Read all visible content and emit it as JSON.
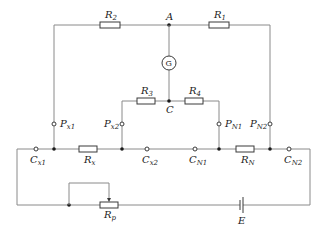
{
  "diagram": {
    "title": "",
    "resistors": {
      "R1": {
        "main": "R",
        "sub": "1"
      },
      "R2": {
        "main": "R",
        "sub": "2"
      },
      "R3": {
        "main": "R",
        "sub": "3"
      },
      "R4": {
        "main": "R",
        "sub": "4"
      },
      "Rx": {
        "main": "R",
        "sub": "x"
      },
      "RN": {
        "main": "R",
        "sub": "N"
      },
      "Rp": {
        "main": "R",
        "sub": "p"
      }
    },
    "nodes": {
      "A": "A",
      "C": "C"
    },
    "galvanometer": {
      "label": "G"
    },
    "battery": {
      "label": "E"
    },
    "potential_terminals": {
      "Px1": {
        "main": "P",
        "sub": "x1"
      },
      "Px2": {
        "main": "P",
        "sub": "x2"
      },
      "PN1": {
        "main": "P",
        "sub": "N1"
      },
      "PN2": {
        "main": "P",
        "sub": "N2"
      }
    },
    "current_terminals": {
      "Cx1": {
        "main": "C",
        "sub": "x1"
      },
      "Cx2": {
        "main": "C",
        "sub": "x2"
      },
      "CN1": {
        "main": "C",
        "sub": "N1"
      },
      "CN2": {
        "main": "C",
        "sub": "N2"
      }
    },
    "colors": {
      "wire": "#8a8a8a",
      "component": "#3a3a3a",
      "text": "#222222",
      "background": "#ffffff"
    }
  }
}
